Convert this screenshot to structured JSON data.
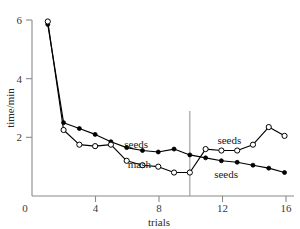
{
  "chart_data": {
    "type": "line",
    "title": "",
    "xlabel": "trials",
    "ylabel": "time/min",
    "xlim": [
      0,
      16.6
    ],
    "ylim": [
      0,
      6.5
    ],
    "xticks": [
      0,
      4,
      8,
      12,
      16
    ],
    "xtick_labels": [
      "0",
      "4",
      "8",
      "12",
      "16"
    ],
    "yticks": [
      0,
      2,
      4,
      6
    ],
    "ytick_labels": [
      "0",
      "2",
      "4",
      "6"
    ],
    "grid": false,
    "legend_position": "inline-annotations",
    "x": [
      1,
      2,
      3,
      4,
      5,
      6,
      7,
      8,
      9,
      10,
      11,
      12,
      13,
      14,
      15,
      16
    ],
    "series": [
      {
        "name": "filled-circles",
        "marker": "filled-circle",
        "values": [
          5.85,
          2.5,
          2.3,
          2.1,
          1.85,
          1.65,
          1.55,
          1.5,
          1.6,
          1.4,
          1.3,
          1.2,
          1.15,
          1.05,
          0.95,
          0.8
        ]
      },
      {
        "name": "open-circles",
        "marker": "open-circle",
        "values": [
          5.95,
          2.25,
          1.75,
          1.7,
          1.75,
          1.2,
          1.05,
          1.0,
          0.8,
          0.8,
          1.6,
          1.55,
          1.55,
          1.75,
          2.35,
          2.05
        ]
      }
    ],
    "annotations": [
      {
        "text": "seeds",
        "x": 6.6,
        "y": 1.62,
        "series": "filled-circles"
      },
      {
        "text": "mash",
        "x": 6.8,
        "y": 0.95,
        "series": "open-circles"
      },
      {
        "text": "seeds",
        "x": 12.5,
        "y": 1.78,
        "series": "open-circles"
      },
      {
        "text": "seeds",
        "x": 12.3,
        "y": 0.62,
        "series": "filled-circles"
      }
    ],
    "reference_lines": [
      {
        "orientation": "vertical",
        "x": 10,
        "y_top": 2.9,
        "y_bottom": 0
      }
    ],
    "colors": {
      "line": "#000000",
      "marker_fill_filled": "#000000",
      "marker_fill_open": "#ffffff",
      "axis": "#8a8a8a",
      "divider": "#9a9a9a",
      "background": "#ffffff"
    }
  }
}
